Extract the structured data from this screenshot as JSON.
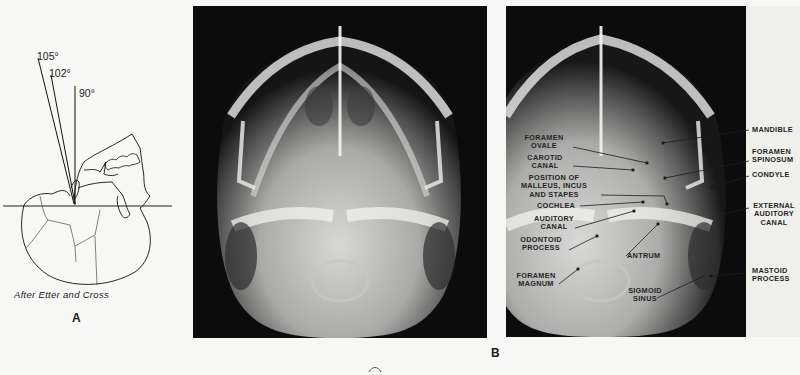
{
  "figure": {
    "panel_a": {
      "letter": "A",
      "credit": "After Etter and Cross",
      "angles": [
        "105°",
        "102°",
        "90°"
      ]
    },
    "panel_b": {
      "letter": "B",
      "labels_left": [
        {
          "id": "foramen-ovale",
          "lines": [
            "FORAMEN",
            "OVALE"
          ]
        },
        {
          "id": "carotid-canal",
          "lines": [
            "CAROTID",
            "CANAL"
          ]
        },
        {
          "id": "ossicles",
          "lines": [
            "POSITION OF",
            "MALLEUS, INCUS",
            "AND STAPES"
          ]
        },
        {
          "id": "cochlea",
          "lines": [
            "COCHLEA"
          ]
        },
        {
          "id": "auditory-canal",
          "lines": [
            "AUDITORY",
            "CANAL"
          ]
        },
        {
          "id": "odontoid-process",
          "lines": [
            "ODONTOID",
            "PROCESS"
          ]
        },
        {
          "id": "foramen-magnum",
          "lines": [
            "FORAMEN",
            "MAGNUM"
          ]
        },
        {
          "id": "antrum",
          "lines": [
            "ANTRUM"
          ]
        },
        {
          "id": "sigmoid-sinus",
          "lines": [
            "SIGMOID",
            "SINUS"
          ]
        }
      ],
      "labels_right": [
        {
          "id": "mandible",
          "lines": [
            "MANDIBLE"
          ]
        },
        {
          "id": "foramen-spinosum",
          "lines": [
            "FORAMEN",
            "SPINOSUM"
          ]
        },
        {
          "id": "condyle",
          "lines": [
            "CONDYLE"
          ]
        },
        {
          "id": "external-auditory-canal",
          "lines": [
            "EXTERNAL",
            "AUDITORY",
            "CANAL"
          ]
        },
        {
          "id": "mastoid-process",
          "lines": [
            "MASTOID",
            "PROCESS"
          ]
        }
      ]
    },
    "colors": {
      "paper": "#f7f7f5",
      "xray_dark": "#0c0c0c",
      "ink": "#1a1a1a"
    }
  }
}
